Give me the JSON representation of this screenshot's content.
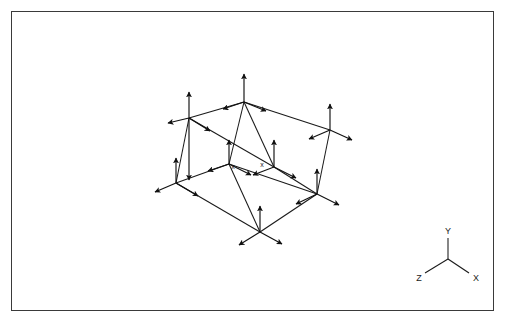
{
  "figure": {
    "title": "",
    "type": "3d-lattice-displacement-diagram",
    "frame": {
      "stroke": "#3a3a3a",
      "fill": "#ffffff"
    },
    "line_color": "#1a1a1a",
    "arrow_color": "#111111"
  },
  "axis_triad": {
    "name": "coordinate-axes",
    "origin": [
      447,
      258
    ],
    "labels": {
      "x": "X",
      "y": "Y",
      "z": "Z"
    },
    "endpoints": {
      "x": [
        468,
        272
      ],
      "y": [
        447,
        236
      ],
      "z": [
        424,
        272
      ]
    }
  },
  "site_markers": [
    {
      "label": "x",
      "x": 232,
      "y": 154
    },
    {
      "label": "x",
      "x": 261,
      "y": 152
    }
  ],
  "lattice": {
    "description": "Rectangular 2x1x1 unit cell drawn in oblique projection; every lattice vertex carries a three-vector displacement cluster.",
    "vertices": [
      {
        "id": "top-back-left",
        "x": 188,
        "y": 117
      },
      {
        "id": "top-back-mid",
        "x": 243,
        "y": 101
      },
      {
        "id": "top-back-right",
        "x": 329,
        "y": 129
      },
      {
        "id": "top-front-left",
        "x": 175,
        "y": 182
      },
      {
        "id": "top-front-mid",
        "x": 228,
        "y": 163
      },
      {
        "id": "top-front-right",
        "x": 316,
        "y": 193
      },
      {
        "id": "mid-node-a",
        "x": 273,
        "y": 166
      },
      {
        "id": "bot-front-mid",
        "x": 259,
        "y": 231
      }
    ],
    "edges": [
      [
        "top-back-left",
        "top-back-mid"
      ],
      [
        "top-back-mid",
        "top-back-right"
      ],
      [
        "top-front-left",
        "top-front-mid"
      ],
      [
        "top-front-mid",
        "top-front-right"
      ],
      [
        "top-back-left",
        "top-front-left"
      ],
      [
        "top-back-mid",
        "top-front-mid"
      ],
      [
        "top-back-right",
        "top-front-right"
      ],
      [
        "top-back-mid",
        "mid-node-a"
      ],
      [
        "top-front-mid",
        "bot-front-mid"
      ],
      [
        "mid-node-a",
        "bot-front-mid"
      ]
    ],
    "arrow_clusters": {
      "up_triple": {
        "description": "vertical up arrow plus left and right-down arrows",
        "vectors": [
          [
            0,
            -28
          ],
          [
            -20,
            6
          ],
          [
            20,
            8
          ]
        ]
      },
      "down_triple": {
        "description": "vertical up arrow plus two down-splayed arrows",
        "vectors": [
          [
            0,
            -26
          ],
          [
            -20,
            12
          ],
          [
            20,
            12
          ]
        ]
      }
    }
  }
}
